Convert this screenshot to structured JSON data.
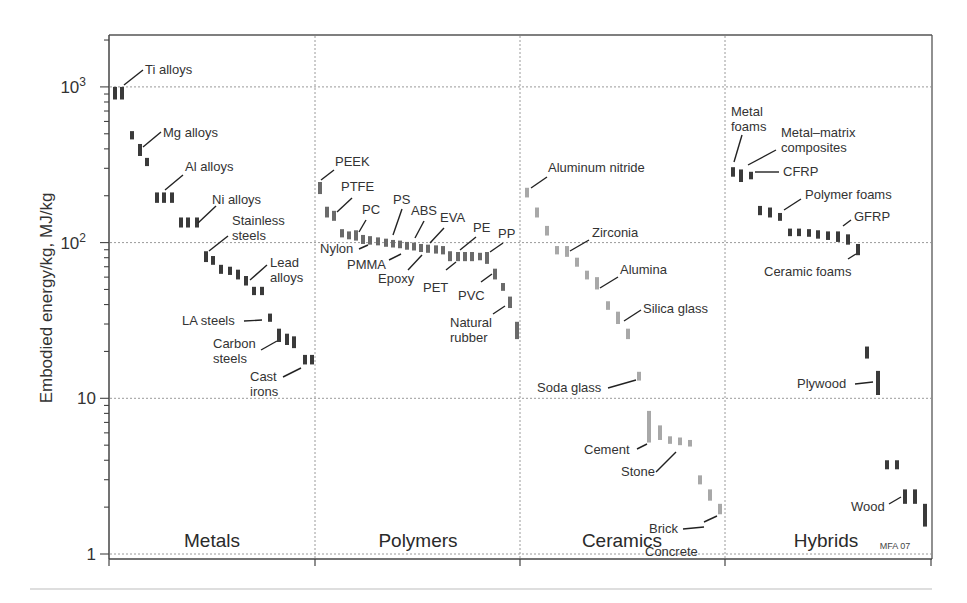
{
  "chart_data": {
    "type": "scatter",
    "title": "",
    "xlabel": "",
    "ylabel": "Embodied energy/kg, MJ/kg",
    "yscale": "log",
    "ylim": [
      1,
      2000
    ],
    "grid": true,
    "y_ticks": [
      {
        "value": 1,
        "label": "1"
      },
      {
        "value": 10,
        "label": "10"
      },
      {
        "value": 100,
        "label": "10",
        "sup": "2"
      },
      {
        "value": 1000,
        "label": "10",
        "sup": "3"
      }
    ],
    "families": [
      {
        "name": "Metals",
        "color": "#3a3a3a"
      },
      {
        "name": "Polymers",
        "color": "#6a6a6a"
      },
      {
        "name": "Ceramics",
        "color": "#a8a8a8"
      },
      {
        "name": "Hybrids",
        "color": "#3a3a3a"
      }
    ],
    "credit": "MFA 07",
    "bars": [
      {
        "family": "Metals",
        "x": 115,
        "lo": 830,
        "hi": 1000
      },
      {
        "family": "Metals",
        "x": 122,
        "lo": 830,
        "hi": 1000
      },
      {
        "family": "Metals",
        "x": 132,
        "lo": 460,
        "hi": 520
      },
      {
        "family": "Metals",
        "x": 140,
        "lo": 360,
        "hi": 430
      },
      {
        "family": "Metals",
        "x": 147,
        "lo": 310,
        "hi": 350
      },
      {
        "family": "Metals",
        "x": 157,
        "lo": 180,
        "hi": 210
      },
      {
        "family": "Metals",
        "x": 164,
        "lo": 180,
        "hi": 210
      },
      {
        "family": "Metals",
        "x": 172,
        "lo": 180,
        "hi": 210
      },
      {
        "family": "Metals",
        "x": 181,
        "lo": 125,
        "hi": 145
      },
      {
        "family": "Metals",
        "x": 188,
        "lo": 125,
        "hi": 145
      },
      {
        "family": "Metals",
        "x": 197,
        "lo": 125,
        "hi": 145
      },
      {
        "family": "Metals",
        "x": 206,
        "lo": 75,
        "hi": 88
      },
      {
        "family": "Metals",
        "x": 213,
        "lo": 72,
        "hi": 82
      },
      {
        "family": "Metals",
        "x": 221,
        "lo": 63,
        "hi": 72
      },
      {
        "family": "Metals",
        "x": 230,
        "lo": 62,
        "hi": 70
      },
      {
        "family": "Metals",
        "x": 238,
        "lo": 58,
        "hi": 67
      },
      {
        "family": "Metals",
        "x": 246,
        "lo": 53,
        "hi": 61
      },
      {
        "family": "Metals",
        "x": 254,
        "lo": 46,
        "hi": 52
      },
      {
        "family": "Metals",
        "x": 262,
        "lo": 46,
        "hi": 52
      },
      {
        "family": "Metals",
        "x": 270,
        "lo": 31,
        "hi": 35
      },
      {
        "family": "Metals",
        "x": 279,
        "lo": 23,
        "hi": 28
      },
      {
        "family": "Metals",
        "x": 287,
        "lo": 22,
        "hi": 26
      },
      {
        "family": "Metals",
        "x": 294,
        "lo": 21,
        "hi": 25
      },
      {
        "family": "Metals",
        "x": 305,
        "lo": 16.5,
        "hi": 19
      },
      {
        "family": "Metals",
        "x": 312,
        "lo": 16.5,
        "hi": 19
      },
      {
        "family": "Polymers",
        "x": 320,
        "lo": 205,
        "hi": 245
      },
      {
        "family": "Polymers",
        "x": 327,
        "lo": 145,
        "hi": 170
      },
      {
        "family": "Polymers",
        "x": 334,
        "lo": 138,
        "hi": 160
      },
      {
        "family": "Polymers",
        "x": 342,
        "lo": 108,
        "hi": 122
      },
      {
        "family": "Polymers",
        "x": 349,
        "lo": 105,
        "hi": 118
      },
      {
        "family": "Polymers",
        "x": 356,
        "lo": 103,
        "hi": 120
      },
      {
        "family": "Polymers",
        "x": 363,
        "lo": 98,
        "hi": 112
      },
      {
        "family": "Polymers",
        "x": 370,
        "lo": 97,
        "hi": 110
      },
      {
        "family": "Polymers",
        "x": 378,
        "lo": 96,
        "hi": 108
      },
      {
        "family": "Polymers",
        "x": 386,
        "lo": 94,
        "hi": 106
      },
      {
        "family": "Polymers",
        "x": 393,
        "lo": 93,
        "hi": 104
      },
      {
        "family": "Polymers",
        "x": 400,
        "lo": 92,
        "hi": 103
      },
      {
        "family": "Polymers",
        "x": 407,
        "lo": 90,
        "hi": 101
      },
      {
        "family": "Polymers",
        "x": 414,
        "lo": 89,
        "hi": 100
      },
      {
        "family": "Polymers",
        "x": 421,
        "lo": 87,
        "hi": 98
      },
      {
        "family": "Polymers",
        "x": 428,
        "lo": 86,
        "hi": 97
      },
      {
        "family": "Polymers",
        "x": 436,
        "lo": 85,
        "hi": 96
      },
      {
        "family": "Polymers",
        "x": 443,
        "lo": 84,
        "hi": 95
      },
      {
        "family": "Polymers",
        "x": 450,
        "lo": 76,
        "hi": 88
      },
      {
        "family": "Polymers",
        "x": 458,
        "lo": 76,
        "hi": 87
      },
      {
        "family": "Polymers",
        "x": 465,
        "lo": 76,
        "hi": 87
      },
      {
        "family": "Polymers",
        "x": 472,
        "lo": 76,
        "hi": 87
      },
      {
        "family": "Polymers",
        "x": 480,
        "lo": 77,
        "hi": 86
      },
      {
        "family": "Polymers",
        "x": 487,
        "lo": 73,
        "hi": 87
      },
      {
        "family": "Polymers",
        "x": 495,
        "lo": 58,
        "hi": 68
      },
      {
        "family": "Polymers",
        "x": 503,
        "lo": 49,
        "hi": 55
      },
      {
        "family": "Polymers",
        "x": 510,
        "lo": 38,
        "hi": 45
      },
      {
        "family": "Polymers",
        "x": 517,
        "lo": 24,
        "hi": 31
      },
      {
        "family": "Ceramics",
        "x": 527,
        "lo": 195,
        "hi": 225
      },
      {
        "family": "Ceramics",
        "x": 537,
        "lo": 145,
        "hi": 168
      },
      {
        "family": "Ceramics",
        "x": 547,
        "lo": 111,
        "hi": 128
      },
      {
        "family": "Ceramics",
        "x": 557,
        "lo": 84,
        "hi": 95
      },
      {
        "family": "Ceramics",
        "x": 567,
        "lo": 81,
        "hi": 95
      },
      {
        "family": "Ceramics",
        "x": 577,
        "lo": 70,
        "hi": 80
      },
      {
        "family": "Ceramics",
        "x": 587,
        "lo": 58,
        "hi": 66
      },
      {
        "family": "Ceramics",
        "x": 597,
        "lo": 50,
        "hi": 60
      },
      {
        "family": "Ceramics",
        "x": 608,
        "lo": 37,
        "hi": 42
      },
      {
        "family": "Ceramics",
        "x": 618,
        "lo": 30,
        "hi": 36
      },
      {
        "family": "Ceramics",
        "x": 628,
        "lo": 24,
        "hi": 28
      },
      {
        "family": "Ceramics",
        "x": 639,
        "lo": 13,
        "hi": 14.8
      },
      {
        "family": "Ceramics",
        "x": 649,
        "lo": 5.2,
        "hi": 8.3
      },
      {
        "family": "Ceramics",
        "x": 660,
        "lo": 5.4,
        "hi": 6.7
      },
      {
        "family": "Ceramics",
        "x": 670,
        "lo": 5.1,
        "hi": 5.7
      },
      {
        "family": "Ceramics",
        "x": 680,
        "lo": 5,
        "hi": 5.6
      },
      {
        "family": "Ceramics",
        "x": 690,
        "lo": 4.9,
        "hi": 5.4
      },
      {
        "family": "Ceramics",
        "x": 700,
        "lo": 2.8,
        "hi": 3.2
      },
      {
        "family": "Ceramics",
        "x": 710,
        "lo": 2.2,
        "hi": 2.6
      },
      {
        "family": "Ceramics",
        "x": 720,
        "lo": 1.8,
        "hi": 2.1
      },
      {
        "family": "Hybrids",
        "x": 733,
        "lo": 265,
        "hi": 305
      },
      {
        "family": "Hybrids",
        "x": 741,
        "lo": 245,
        "hi": 295
      },
      {
        "family": "Hybrids",
        "x": 751,
        "lo": 255,
        "hi": 285
      },
      {
        "family": "Hybrids",
        "x": 760,
        "lo": 150,
        "hi": 172
      },
      {
        "family": "Hybrids",
        "x": 770,
        "lo": 145,
        "hi": 168
      },
      {
        "family": "Hybrids",
        "x": 780,
        "lo": 138,
        "hi": 155
      },
      {
        "family": "Hybrids",
        "x": 790,
        "lo": 110,
        "hi": 123
      },
      {
        "family": "Hybrids",
        "x": 799,
        "lo": 110,
        "hi": 123
      },
      {
        "family": "Hybrids",
        "x": 809,
        "lo": 109,
        "hi": 122
      },
      {
        "family": "Hybrids",
        "x": 818,
        "lo": 106,
        "hi": 120
      },
      {
        "family": "Hybrids",
        "x": 828,
        "lo": 104,
        "hi": 118
      },
      {
        "family": "Hybrids",
        "x": 838,
        "lo": 101,
        "hi": 118
      },
      {
        "family": "Hybrids",
        "x": 848,
        "lo": 97,
        "hi": 113
      },
      {
        "family": "Hybrids",
        "x": 858,
        "lo": 83,
        "hi": 98
      },
      {
        "family": "Hybrids",
        "x": 867,
        "lo": 18,
        "hi": 21.5
      },
      {
        "family": "Hybrids",
        "x": 878,
        "lo": 10.5,
        "hi": 15
      },
      {
        "family": "Hybrids",
        "x": 887,
        "lo": 3.5,
        "hi": 4
      },
      {
        "family": "Hybrids",
        "x": 897,
        "lo": 3.5,
        "hi": 4
      },
      {
        "family": "Hybrids",
        "x": 905,
        "lo": 2.1,
        "hi": 2.6
      },
      {
        "family": "Hybrids",
        "x": 915,
        "lo": 2.1,
        "hi": 2.6
      },
      {
        "family": "Hybrids",
        "x": 925,
        "lo": 1.5,
        "hi": 2.1
      }
    ],
    "labels": [
      {
        "text": [
          "Ti alloys"
        ],
        "x": 145,
        "y": 74,
        "lx1": 124,
        "ly1": 85,
        "lx2": 143,
        "ly2": 70
      },
      {
        "text": [
          "Mg alloys"
        ],
        "x": 163,
        "y": 137,
        "lx1": 143,
        "ly1": 147,
        "lx2": 161,
        "ly2": 132
      },
      {
        "text": [
          "Al alloys"
        ],
        "x": 185,
        "y": 171,
        "lx1": 165,
        "ly1": 190,
        "lx2": 183,
        "ly2": 175
      },
      {
        "text": [
          "Ni alloys"
        ],
        "x": 212,
        "y": 204,
        "lx1": 198,
        "ly1": 223,
        "lx2": 216,
        "ly2": 206
      },
      {
        "text": [
          "Stainless",
          "steels"
        ],
        "x": 232,
        "y": 225,
        "lx1": 209,
        "ly1": 251,
        "lx2": 228,
        "ly2": 236
      },
      {
        "text": [
          "Lead",
          "alloys"
        ],
        "x": 270,
        "y": 267,
        "lx1": 250,
        "ly1": 280,
        "lx2": 267,
        "ly2": 265
      },
      {
        "text": [
          "LA steels"
        ],
        "x": 182,
        "y": 325,
        "lx1": 244,
        "ly1": 321,
        "lx2": 262,
        "ly2": 320
      },
      {
        "text": [
          "Carbon",
          "steels"
        ],
        "x": 213,
        "y": 348,
        "lx1": 261,
        "ly1": 350,
        "lx2": 277,
        "ly2": 341
      },
      {
        "text": [
          "Cast",
          "irons"
        ],
        "x": 250,
        "y": 381,
        "lx1": 283,
        "ly1": 377,
        "lx2": 301,
        "ly2": 368
      },
      {
        "text": [
          "PEEK"
        ],
        "x": 335,
        "y": 166,
        "lx1": 321,
        "ly1": 180,
        "lx2": 334,
        "ly2": 170
      },
      {
        "text": [
          "PTFE"
        ],
        "x": 341,
        "y": 191,
        "lx1": 337,
        "ly1": 212,
        "lx2": 352,
        "ly2": 198
      },
      {
        "text": [
          "PC"
        ],
        "x": 362,
        "y": 214,
        "lx1": 359,
        "ly1": 232,
        "lx2": 366,
        "ly2": 220
      },
      {
        "text": [
          "Nylon"
        ],
        "x": 320,
        "y": 253,
        "lx1": 359,
        "ly1": 249,
        "lx2": 368,
        "ly2": 245
      },
      {
        "text": [
          "PS"
        ],
        "x": 393,
        "y": 204,
        "lx1": 393,
        "ly1": 235,
        "lx2": 402,
        "ly2": 209
      },
      {
        "text": [
          "ABS"
        ],
        "x": 411,
        "y": 215,
        "lx1": 415,
        "ly1": 238,
        "lx2": 424,
        "ly2": 221
      },
      {
        "text": [
          "EVA"
        ],
        "x": 440,
        "y": 222,
        "lx1": 430,
        "ly1": 243,
        "lx2": 444,
        "ly2": 228
      },
      {
        "text": [
          "PMMA"
        ],
        "x": 347,
        "y": 269,
        "lx1": 389,
        "ly1": 260,
        "lx2": 401,
        "ly2": 254
      },
      {
        "text": [
          "Epoxy"
        ],
        "x": 378,
        "y": 283,
        "lx1": 408,
        "ly1": 270,
        "lx2": 422,
        "ly2": 255
      },
      {
        "text": [
          "PE"
        ],
        "x": 473,
        "y": 232,
        "lx1": 460,
        "ly1": 250,
        "lx2": 476,
        "ly2": 237
      },
      {
        "text": [
          "PP"
        ],
        "x": 498,
        "y": 238,
        "lx1": 490,
        "ly1": 252,
        "lx2": 503,
        "ly2": 243
      },
      {
        "text": [
          "PET"
        ],
        "x": 423,
        "y": 292,
        "lx1": 446,
        "ly1": 270,
        "lx2": 456,
        "ly2": 262
      },
      {
        "text": [
          "PVC"
        ],
        "x": 458,
        "y": 300,
        "lx1": 481,
        "ly1": 282,
        "lx2": 492,
        "ly2": 274
      },
      {
        "text": [
          "Natural",
          "rubber"
        ],
        "x": 450,
        "y": 327,
        "lx1": 493,
        "ly1": 314,
        "lx2": 505,
        "ly2": 306
      },
      {
        "text": [
          "Aluminum nitride"
        ],
        "x": 548,
        "y": 172,
        "lx1": 531,
        "ly1": 188,
        "lx2": 547,
        "ly2": 177
      },
      {
        "text": [
          "Zirconia"
        ],
        "x": 592,
        "y": 237,
        "lx1": 570,
        "ly1": 251,
        "lx2": 589,
        "ly2": 240
      },
      {
        "text": [
          "Alumina"
        ],
        "x": 620,
        "y": 274,
        "lx1": 600,
        "ly1": 288,
        "lx2": 618,
        "ly2": 277
      },
      {
        "text": [
          "Silica glass"
        ],
        "x": 643,
        "y": 313,
        "lx1": 624,
        "ly1": 321,
        "lx2": 641,
        "ly2": 310
      },
      {
        "text": [
          "Soda glass"
        ],
        "x": 537,
        "y": 392,
        "lx1": 608,
        "ly1": 388,
        "lx2": 636,
        "ly2": 380
      },
      {
        "text": [
          "Cement"
        ],
        "x": 584,
        "y": 454,
        "lx1": 637,
        "ly1": 449,
        "lx2": 647,
        "ly2": 444
      },
      {
        "text": [
          "Stone"
        ],
        "x": 621,
        "y": 476,
        "lx1": 656,
        "ly1": 472,
        "lx2": 676,
        "ly2": 452
      },
      {
        "text": [
          "Brick"
        ],
        "x": 649,
        "y": 533,
        "lx1": 683,
        "ly1": 529,
        "lx2": 704,
        "ly2": 527
      },
      {
        "text": [
          "Concrete"
        ],
        "x": 645,
        "y": 556,
        "lx1": 704,
        "ly1": 522,
        "lx2": 717,
        "ly2": 516
      },
      {
        "text": [
          "Metal",
          "foams"
        ],
        "x": 731,
        "y": 116,
        "lx1": 734,
        "ly1": 162,
        "lx2": 742,
        "ly2": 135
      },
      {
        "text": [
          "Metal–matrix",
          "composites"
        ],
        "x": 781,
        "y": 137,
        "lx1": 748,
        "ly1": 165,
        "lx2": 776,
        "ly2": 150
      },
      {
        "text": [
          "CFRP"
        ],
        "x": 783,
        "y": 176,
        "lx1": 755,
        "ly1": 172,
        "lx2": 779,
        "ly2": 172
      },
      {
        "text": [
          "Polymer foams"
        ],
        "x": 805,
        "y": 199,
        "lx1": 784,
        "ly1": 210,
        "lx2": 801,
        "ly2": 199
      },
      {
        "text": [
          "GFRP"
        ],
        "x": 854,
        "y": 221,
        "lx1": 843,
        "ly1": 226,
        "lx2": 851,
        "ly2": 220
      },
      {
        "text": [
          "Ceramic foams"
        ],
        "x": 764,
        "y": 276,
        "lx1": 848,
        "ly1": 259,
        "lx2": 856,
        "ly2": 254
      },
      {
        "text": [
          "Plywood"
        ],
        "x": 797,
        "y": 388,
        "lx1": 855,
        "ly1": 384,
        "lx2": 873,
        "ly2": 382
      },
      {
        "text": [
          "Wood"
        ],
        "x": 851,
        "y": 511,
        "lx1": 889,
        "ly1": 504,
        "lx2": 901,
        "ly2": 497
      }
    ]
  }
}
